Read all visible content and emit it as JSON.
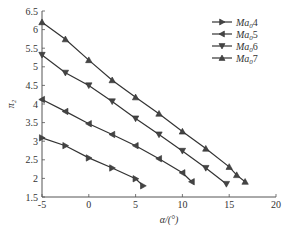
{
  "chart_data": {
    "type": "line",
    "title": "",
    "xlabel": "α/(°)",
    "ylabel": "π₂",
    "xlim": [
      -5,
      20
    ],
    "ylim": [
      1.5,
      6.5
    ],
    "xticks": [
      -5,
      0,
      5,
      10,
      15,
      20
    ],
    "yticks": [
      1.5,
      2,
      2.5,
      3,
      3.5,
      4,
      4.5,
      5,
      5.5,
      6,
      6.5
    ],
    "grid": false,
    "legend_position": "upper right",
    "series": [
      {
        "name": "Ma04",
        "label_main": "Ma",
        "label_sub": "0",
        "label_num": "4",
        "marker": "triangle-right",
        "x": [
          -5,
          -2.5,
          0,
          2.5,
          5,
          5.8
        ],
        "y": [
          3.09,
          2.88,
          2.55,
          2.28,
          1.99,
          1.8
        ]
      },
      {
        "name": "Ma05",
        "label_main": "Ma",
        "label_sub": "0",
        "label_num": "5",
        "marker": "triangle-left",
        "x": [
          -5,
          -2.5,
          0,
          2.5,
          5,
          7.5,
          10,
          11
        ],
        "y": [
          4.12,
          3.8,
          3.47,
          3.18,
          2.88,
          2.53,
          2.15,
          1.91
        ]
      },
      {
        "name": "Ma06",
        "label_main": "Ma",
        "label_sub": "0",
        "label_num": "6",
        "marker": "triangle-down",
        "x": [
          -5,
          -2.5,
          0,
          2.5,
          5,
          7.5,
          10,
          12.5,
          14.7
        ],
        "y": [
          5.32,
          4.84,
          4.5,
          4.07,
          3.61,
          3.18,
          2.74,
          2.28,
          1.85
        ]
      },
      {
        "name": "Ma07",
        "label_main": "Ma",
        "label_sub": "0",
        "label_num": "7",
        "marker": "triangle-up",
        "x": [
          -5,
          -2.5,
          0,
          2.5,
          5,
          7.5,
          10,
          12.5,
          15,
          15.8,
          16.7
        ],
        "y": [
          6.2,
          5.74,
          5.18,
          4.64,
          4.18,
          3.74,
          3.26,
          2.8,
          2.31,
          2.09,
          1.91
        ]
      }
    ]
  },
  "colors": {
    "line": "#333333",
    "axis": "#555555",
    "text": "#333333"
  }
}
